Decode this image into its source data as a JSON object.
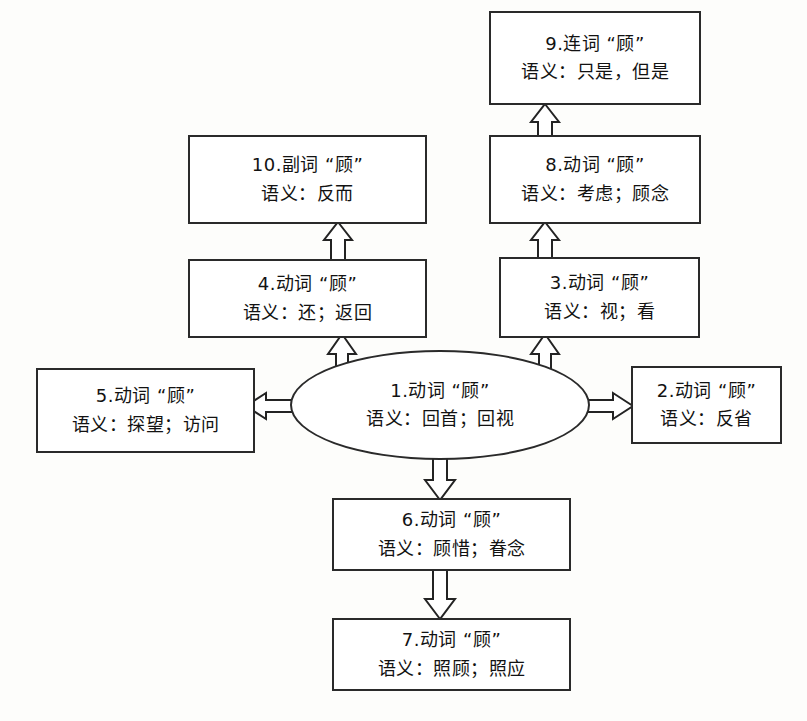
{
  "diagram": {
    "type": "semantic-network",
    "stroke_color": "#232323",
    "fill_color": "#ffffff",
    "nodes": [
      {
        "id": "n1",
        "shape": "ellipse",
        "line1": "1.动词 “顾”",
        "line2": "语义：回首；回视"
      },
      {
        "id": "n2",
        "shape": "rect",
        "line1": "2.动词 “顾”",
        "line2": "语义：反省"
      },
      {
        "id": "n3",
        "shape": "rect",
        "line1": "3.动词 “顾”",
        "line2": "语义：视；看"
      },
      {
        "id": "n4",
        "shape": "rect",
        "line1": "4.动词 “顾”",
        "line2": "语义：还；返回"
      },
      {
        "id": "n5",
        "shape": "rect",
        "line1": "5.动词 “顾”",
        "line2": "语义：探望；访问"
      },
      {
        "id": "n6",
        "shape": "rect",
        "line1": "6.动词 “顾”",
        "line2": "语义：顾惜；眷念"
      },
      {
        "id": "n7",
        "shape": "rect",
        "line1": "7.动词 “顾”",
        "line2": "语义：照顾；照应"
      },
      {
        "id": "n8",
        "shape": "rect",
        "line1": "8.动词 “顾”",
        "line2": "语义：考虑；顾念"
      },
      {
        "id": "n9",
        "shape": "rect",
        "line1": "9.连词 “顾”",
        "line2": "语义：只是，但是"
      },
      {
        "id": "n10",
        "shape": "rect",
        "line1": "10.副词 “顾”",
        "line2": "语义：反而"
      }
    ],
    "edges": [
      {
        "from": "n1",
        "to": "n5",
        "direction": "left"
      },
      {
        "from": "n1",
        "to": "n2",
        "direction": "right"
      },
      {
        "from": "n1",
        "to": "n4",
        "direction": "up"
      },
      {
        "from": "n1",
        "to": "n3",
        "direction": "up"
      },
      {
        "from": "n1",
        "to": "n6",
        "direction": "down"
      },
      {
        "from": "n4",
        "to": "n10",
        "direction": "up"
      },
      {
        "from": "n3",
        "to": "n8",
        "direction": "up"
      },
      {
        "from": "n8",
        "to": "n9",
        "direction": "up"
      },
      {
        "from": "n6",
        "to": "n7",
        "direction": "down"
      }
    ]
  }
}
